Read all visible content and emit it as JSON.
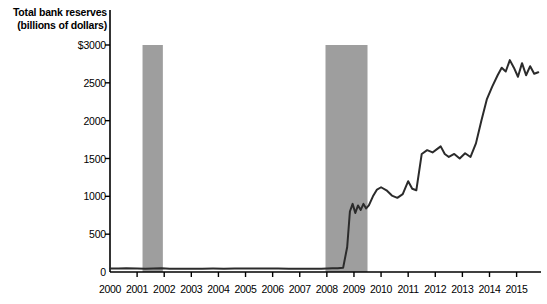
{
  "chart_data": {
    "type": "line",
    "title": "Total bank reserves (billions of dollars)",
    "title_lines": [
      "Total bank reserves",
      "(billions of dollars)"
    ],
    "xlabel": "",
    "ylabel": "Total bank reserves (billions of dollars)",
    "xlim": [
      2000,
      2015.9
    ],
    "ylim": [
      0,
      3000
    ],
    "grid": false,
    "legend": false,
    "y_ticks": [
      0,
      500,
      1000,
      1500,
      2000,
      2500,
      3000
    ],
    "y_tick_labels": [
      "0",
      "500",
      "1000",
      "1500",
      "2000",
      "2500",
      "$3000"
    ],
    "x_ticks": [
      2000,
      2001,
      2002,
      2003,
      2004,
      2005,
      2006,
      2007,
      2008,
      2009,
      2010,
      2011,
      2012,
      2013,
      2014,
      2015
    ],
    "x_tick_labels": [
      "2000",
      "2001",
      "2002",
      "2003",
      "2004",
      "2005",
      "2006",
      "2007",
      "2008",
      "2009",
      "2010",
      "2011",
      "2012",
      "2013",
      "2014",
      "2015"
    ],
    "line_color": "#2b2b2b",
    "recession_band_color": "#9e9e9e",
    "recession_bands": [
      {
        "start": 2001.2,
        "end": 2001.95,
        "top_value": 3000
      },
      {
        "start": 2007.95,
        "end": 2009.5,
        "top_value": 3000
      }
    ],
    "series": [
      {
        "name": "Total bank reserves",
        "x": [
          2000.0,
          2000.3,
          2000.6,
          2001.0,
          2001.3,
          2001.6,
          2001.9,
          2002.2,
          2002.6,
          2003.0,
          2003.4,
          2003.8,
          2004.2,
          2004.6,
          2005.0,
          2005.4,
          2005.8,
          2006.2,
          2006.6,
          2007.0,
          2007.4,
          2007.8,
          2008.0,
          2008.2,
          2008.4,
          2008.6,
          2008.75,
          2008.85,
          2008.95,
          2009.05,
          2009.15,
          2009.25,
          2009.35,
          2009.45,
          2009.55,
          2009.7,
          2009.85,
          2010.0,
          2010.2,
          2010.4,
          2010.6,
          2010.8,
          2011.0,
          2011.15,
          2011.3,
          2011.5,
          2011.7,
          2011.9,
          2012.05,
          2012.2,
          2012.35,
          2012.5,
          2012.7,
          2012.9,
          2013.1,
          2013.3,
          2013.5,
          2013.7,
          2013.9,
          2014.1,
          2014.3,
          2014.45,
          2014.6,
          2014.75,
          2014.9,
          2015.05,
          2015.2,
          2015.35,
          2015.5,
          2015.65,
          2015.8
        ],
        "y": [
          45,
          45,
          48,
          45,
          42,
          45,
          50,
          42,
          44,
          42,
          44,
          45,
          44,
          46,
          45,
          46,
          45,
          45,
          44,
          44,
          43,
          43,
          45,
          48,
          50,
          55,
          330,
          800,
          900,
          780,
          880,
          820,
          900,
          840,
          880,
          1000,
          1090,
          1120,
          1080,
          1010,
          980,
          1030,
          1200,
          1100,
          1080,
          1560,
          1610,
          1580,
          1620,
          1660,
          1560,
          1520,
          1560,
          1500,
          1570,
          1520,
          1700,
          2000,
          2280,
          2450,
          2600,
          2700,
          2650,
          2800,
          2700,
          2580,
          2760,
          2600,
          2720,
          2620,
          2640
        ]
      }
    ]
  }
}
